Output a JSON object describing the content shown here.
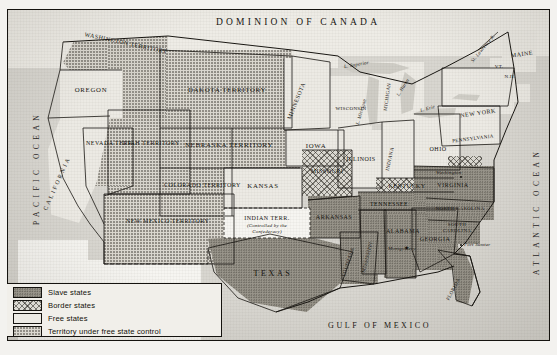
{
  "map": {
    "title_top": "DOMINION OF CANADA",
    "oceans": [
      {
        "name": "pacific-ocean",
        "text": "PACIFIC OCEAN"
      },
      {
        "name": "atlantic-ocean",
        "text": "ATLANTIC OCEAN"
      },
      {
        "name": "gulf-of-mexico",
        "text": "GULF OF MEXICO"
      }
    ],
    "countries": [
      {
        "name": "canada",
        "text": "DOMINION OF CANADA"
      },
      {
        "name": "mexico",
        "text": "MEXICO"
      }
    ],
    "lakes": [
      {
        "name": "lake-superior",
        "text": "L. Superior"
      },
      {
        "name": "lake-michigan",
        "text": "L. Michigan"
      },
      {
        "name": "lake-huron",
        "text": "L. Huron"
      },
      {
        "name": "lake-erie",
        "text": "L. Erie"
      }
    ],
    "rivers": [
      {
        "name": "st-lawrence-river",
        "text": "St. Lawrence R."
      }
    ],
    "regions": [
      {
        "name": "washington-territory",
        "text": "WASHINGTON TERRITORY",
        "category": "territory"
      },
      {
        "name": "oregon",
        "text": "OREGON",
        "category": "free"
      },
      {
        "name": "california",
        "text": "CALIFORNIA",
        "category": "free"
      },
      {
        "name": "nevada-territory",
        "text": "NEVADA TERR.",
        "category": "territory"
      },
      {
        "name": "utah-territory",
        "text": "UTAH TERRITORY",
        "category": "territory"
      },
      {
        "name": "new-mexico-territory",
        "text": "NEW MEXICO TERRITORY",
        "category": "territory"
      },
      {
        "name": "colorado-territory",
        "text": "COLORADO TERRITORY",
        "category": "territory"
      },
      {
        "name": "dakota-territory",
        "text": "DAKOTA TERRITORY",
        "category": "territory"
      },
      {
        "name": "nebraska-territory",
        "text": "NEBRASKA TERRITORY",
        "category": "territory"
      },
      {
        "name": "kansas",
        "text": "KANSAS",
        "category": "free"
      },
      {
        "name": "indian-territory",
        "text": "INDIAN TERR.",
        "category": "confederate-controlled"
      },
      {
        "name": "indian-territory-note",
        "text": "(Controlled by the Confederacy)",
        "category": "note"
      },
      {
        "name": "minnesota",
        "text": "MINNESOTA",
        "category": "free"
      },
      {
        "name": "iowa",
        "text": "IOWA",
        "category": "free"
      },
      {
        "name": "missouri",
        "text": "MISSOURI",
        "category": "border"
      },
      {
        "name": "arkansas",
        "text": "ARKANSAS",
        "category": "slave"
      },
      {
        "name": "texas",
        "text": "TEXAS",
        "category": "slave"
      },
      {
        "name": "louisiana",
        "text": "LOUISIANA",
        "category": "slave"
      },
      {
        "name": "mississippi",
        "text": "MISSISSIPPI",
        "category": "slave"
      },
      {
        "name": "alabama",
        "text": "ALABAMA",
        "category": "slave"
      },
      {
        "name": "georgia",
        "text": "GEORGIA",
        "category": "slave"
      },
      {
        "name": "florida",
        "text": "FLORIDA",
        "category": "slave"
      },
      {
        "name": "tennessee",
        "text": "TENNESSEE",
        "category": "slave"
      },
      {
        "name": "kentucky",
        "text": "KENTUCKY",
        "category": "border"
      },
      {
        "name": "south-carolina",
        "text": "SOUTH CAROLINA",
        "category": "slave"
      },
      {
        "name": "north-carolina",
        "text": "NORTH CAROLINA",
        "category": "slave"
      },
      {
        "name": "virginia",
        "text": "VIRGINIA",
        "category": "slave"
      },
      {
        "name": "ohio",
        "text": "OHIO",
        "category": "free"
      },
      {
        "name": "indiana",
        "text": "INDIANA",
        "category": "free"
      },
      {
        "name": "illinois",
        "text": "ILLINOIS",
        "category": "free"
      },
      {
        "name": "wisconsin",
        "text": "WISCONSIN",
        "category": "free"
      },
      {
        "name": "michigan",
        "text": "MICHIGAN",
        "category": "free"
      },
      {
        "name": "pennsylvania",
        "text": "PENNSYLVANIA",
        "category": "free"
      },
      {
        "name": "new-york",
        "text": "NEW YORK",
        "category": "free"
      },
      {
        "name": "maine",
        "text": "MAINE",
        "category": "free"
      },
      {
        "name": "vermont",
        "text": "VT.",
        "category": "free"
      },
      {
        "name": "new-hampshire",
        "text": "N.H.",
        "category": "free"
      }
    ],
    "cities": [
      {
        "name": "washington-dc",
        "text": "Washington"
      },
      {
        "name": "montgomery",
        "text": "Montgomery"
      },
      {
        "name": "fort-sumter",
        "text": "Fort Sumter"
      }
    ]
  },
  "legend": {
    "items": [
      {
        "name": "legend-slave-states",
        "label": "Slave states",
        "pattern": "slave"
      },
      {
        "name": "legend-border-states",
        "label": "Border states",
        "pattern": "border"
      },
      {
        "name": "legend-free-states",
        "label": "Free states",
        "pattern": "free"
      },
      {
        "name": "legend-territory-free-control",
        "label": "Territory under free state control",
        "pattern": "territory"
      }
    ]
  },
  "colors": {
    "paper": "#e9e8e3",
    "ink": "#15130f",
    "slave": "#9a968c",
    "free": "#eceae4",
    "territory": "#dbd8d0",
    "ocean": "#d8d6d0"
  }
}
